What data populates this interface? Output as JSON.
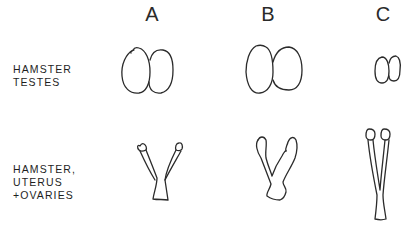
{
  "figure": {
    "columns": [
      {
        "id": "A",
        "label": "A"
      },
      {
        "id": "B",
        "label": "B"
      },
      {
        "id": "C",
        "label": "C"
      }
    ],
    "rows": [
      {
        "id": "testes",
        "label_lines": [
          "HAMSTER",
          "TESTES"
        ],
        "drawings": [
          {
            "column": "A",
            "description": "pair of oval testes, medium size"
          },
          {
            "column": "B",
            "description": "pair of oval testes, largest size"
          },
          {
            "column": "C",
            "description": "pair of oval testes, small/atrophied"
          }
        ]
      },
      {
        "id": "uterus",
        "label_lines": [
          "HAMSTER,",
          "UTERUS",
          "+OVARIES"
        ],
        "drawings": [
          {
            "column": "A",
            "description": "Y-shaped uterus with ovaries, medium horns"
          },
          {
            "column": "B",
            "description": "Y-shaped uterus with ovaries, thick irregular horns"
          },
          {
            "column": "C",
            "description": "Y-shaped uterus with ovaries, thin elongated horns"
          }
        ]
      }
    ],
    "line_color": "#2b2b2b",
    "background": "#ffffff"
  }
}
